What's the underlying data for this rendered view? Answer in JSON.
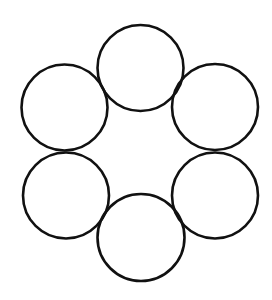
{
  "diagram": {
    "canvas": {
      "width": 272,
      "height": 300,
      "background": "#ffffff"
    },
    "stroke_color": "#111111",
    "stroke_width": 2.6,
    "fill": "none",
    "circles": [
      {
        "name": "top",
        "cx": 140.5,
        "cy": 68,
        "r": 43
      },
      {
        "name": "upper-right",
        "cx": 215,
        "cy": 107,
        "r": 43
      },
      {
        "name": "lower-right",
        "cx": 215,
        "cy": 195.5,
        "r": 43
      },
      {
        "name": "bottom",
        "cx": 141,
        "cy": 237.5,
        "r": 43.5
      },
      {
        "name": "lower-left",
        "cx": 66,
        "cy": 195.5,
        "r": 43
      },
      {
        "name": "upper-left",
        "cx": 64.5,
        "cy": 107.5,
        "r": 43
      }
    ]
  }
}
